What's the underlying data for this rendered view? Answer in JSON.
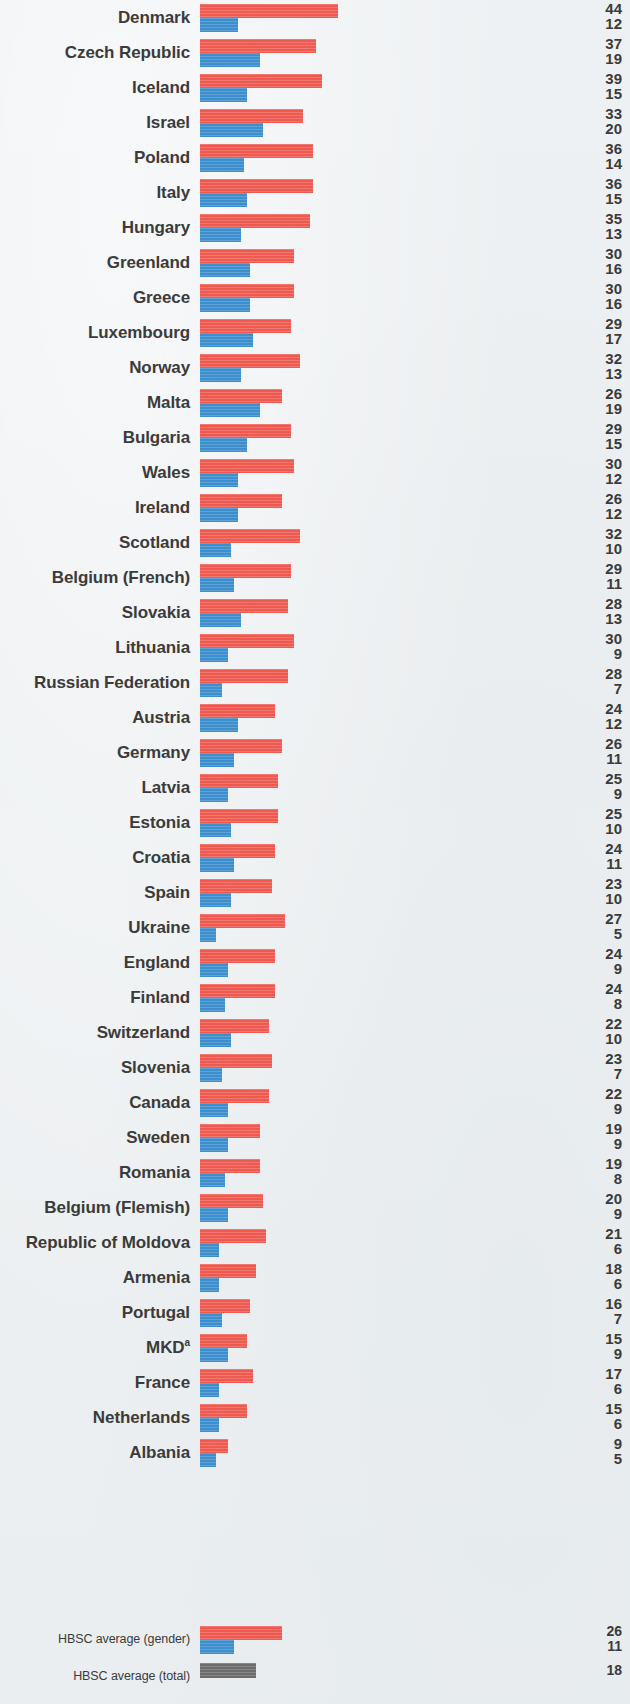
{
  "chart_data": {
    "type": "bar",
    "orientation": "horizontal",
    "title": "",
    "subtitle": "",
    "xlabel": "",
    "ylabel": "",
    "grid": false,
    "legend_position": "none",
    "xlim": [
      0,
      44
    ],
    "value_unit": "%",
    "series": [
      {
        "name": "girls",
        "color": "#ef5a50"
      },
      {
        "name": "boys",
        "color": "#3d8ecd"
      },
      {
        "name": "total",
        "color": "#6d6d6d"
      }
    ],
    "categories": [
      "Denmark",
      "Czech Republic",
      "Iceland",
      "Israel",
      "Poland",
      "Italy",
      "Hungary",
      "Greenland",
      "Greece",
      "Luxembourg",
      "Norway",
      "Malta",
      "Bulgaria",
      "Wales",
      "Ireland",
      "Scotland",
      "Belgium (French)",
      "Slovakia",
      "Lithuania",
      "Russian Federation",
      "Austria",
      "Germany",
      "Latvia",
      "Estonia",
      "Croatia",
      "Spain",
      "Ukraine",
      "England",
      "Finland",
      "Switzerland",
      "Slovenia",
      "Canada",
      "Sweden",
      "Romania",
      "Belgium (Flemish)",
      "Republic of Moldova",
      "Armenia",
      "Portugal",
      "MKD",
      "France",
      "Netherlands",
      "Albania",
      "HBSC average (gender)",
      "HBSC average (total)"
    ],
    "values_red": [
      44,
      37,
      39,
      33,
      36,
      36,
      35,
      30,
      30,
      29,
      32,
      26,
      29,
      30,
      26,
      32,
      29,
      28,
      30,
      28,
      24,
      26,
      25,
      25,
      24,
      23,
      27,
      24,
      24,
      22,
      23,
      22,
      19,
      19,
      20,
      21,
      18,
      16,
      15,
      17,
      15,
      9,
      26,
      null
    ],
    "values_blue": [
      12,
      19,
      15,
      20,
      14,
      15,
      13,
      16,
      16,
      17,
      13,
      19,
      15,
      12,
      12,
      10,
      11,
      13,
      9,
      7,
      12,
      11,
      9,
      10,
      11,
      10,
      5,
      9,
      8,
      10,
      7,
      9,
      9,
      8,
      9,
      6,
      6,
      7,
      9,
      6,
      6,
      5,
      11,
      null
    ],
    "values_gray": [
      null,
      null,
      null,
      null,
      null,
      null,
      null,
      null,
      null,
      null,
      null,
      null,
      null,
      null,
      null,
      null,
      null,
      null,
      null,
      null,
      null,
      null,
      null,
      null,
      null,
      null,
      null,
      null,
      null,
      null,
      null,
      null,
      null,
      null,
      null,
      null,
      null,
      null,
      null,
      null,
      null,
      null,
      null,
      18
    ]
  },
  "rows": [
    {
      "label": "Denmark",
      "sup": "",
      "red": 44,
      "blue": 12
    },
    {
      "label": "Czech Republic",
      "sup": "",
      "red": 37,
      "blue": 19
    },
    {
      "label": "Iceland",
      "sup": "",
      "red": 39,
      "blue": 15
    },
    {
      "label": "Israel",
      "sup": "",
      "red": 33,
      "blue": 20
    },
    {
      "label": "Poland",
      "sup": "",
      "red": 36,
      "blue": 14
    },
    {
      "label": "Italy",
      "sup": "",
      "red": 36,
      "blue": 15
    },
    {
      "label": "Hungary",
      "sup": "",
      "red": 35,
      "blue": 13
    },
    {
      "label": "Greenland",
      "sup": "",
      "red": 30,
      "blue": 16
    },
    {
      "label": "Greece",
      "sup": "",
      "red": 30,
      "blue": 16
    },
    {
      "label": "Luxembourg",
      "sup": "",
      "red": 29,
      "blue": 17
    },
    {
      "label": "Norway",
      "sup": "",
      "red": 32,
      "blue": 13
    },
    {
      "label": "Malta",
      "sup": "",
      "red": 26,
      "blue": 19
    },
    {
      "label": "Bulgaria",
      "sup": "",
      "red": 29,
      "blue": 15
    },
    {
      "label": "Wales",
      "sup": "",
      "red": 30,
      "blue": 12
    },
    {
      "label": "Ireland",
      "sup": "",
      "red": 26,
      "blue": 12
    },
    {
      "label": "Scotland",
      "sup": "",
      "red": 32,
      "blue": 10
    },
    {
      "label": "Belgium (French)",
      "sup": "",
      "red": 29,
      "blue": 11
    },
    {
      "label": "Slovakia",
      "sup": "",
      "red": 28,
      "blue": 13
    },
    {
      "label": "Lithuania",
      "sup": "",
      "red": 30,
      "blue": 9
    },
    {
      "label": "Russian Federation",
      "sup": "",
      "red": 28,
      "blue": 7
    },
    {
      "label": "Austria",
      "sup": "",
      "red": 24,
      "blue": 12
    },
    {
      "label": "Germany",
      "sup": "",
      "red": 26,
      "blue": 11
    },
    {
      "label": "Latvia",
      "sup": "",
      "red": 25,
      "blue": 9
    },
    {
      "label": "Estonia",
      "sup": "",
      "red": 25,
      "blue": 10
    },
    {
      "label": "Croatia",
      "sup": "",
      "red": 24,
      "blue": 11
    },
    {
      "label": "Spain",
      "sup": "",
      "red": 23,
      "blue": 10
    },
    {
      "label": "Ukraine",
      "sup": "",
      "red": 27,
      "blue": 5
    },
    {
      "label": "England",
      "sup": "",
      "red": 24,
      "blue": 9
    },
    {
      "label": "Finland",
      "sup": "",
      "red": 24,
      "blue": 8
    },
    {
      "label": "Switzerland",
      "sup": "",
      "red": 22,
      "blue": 10
    },
    {
      "label": "Slovenia",
      "sup": "",
      "red": 23,
      "blue": 7
    },
    {
      "label": "Canada",
      "sup": "",
      "red": 22,
      "blue": 9
    },
    {
      "label": "Sweden",
      "sup": "",
      "red": 19,
      "blue": 9
    },
    {
      "label": "Romania",
      "sup": "",
      "red": 19,
      "blue": 8
    },
    {
      "label": "Belgium (Flemish)",
      "sup": "",
      "red": 20,
      "blue": 9
    },
    {
      "label": "Republic of Moldova",
      "sup": "",
      "red": 21,
      "blue": 6
    },
    {
      "label": "Armenia",
      "sup": "",
      "red": 18,
      "blue": 6
    },
    {
      "label": "Portugal",
      "sup": "",
      "red": 16,
      "blue": 7
    },
    {
      "label": "MKD",
      "sup": "a",
      "red": 15,
      "blue": 9
    },
    {
      "label": "France",
      "sup": "",
      "red": 17,
      "blue": 6
    },
    {
      "label": "Netherlands",
      "sup": "",
      "red": 15,
      "blue": 6
    },
    {
      "label": "Albania",
      "sup": "",
      "red": 9,
      "blue": 5
    }
  ],
  "averages": [
    {
      "label": "HBSC average (gender)",
      "sup": "",
      "red": 26,
      "blue": 11
    },
    {
      "label": "HBSC average (total)",
      "sup": "",
      "gray": 18
    }
  ],
  "style": {
    "red": "#ef5a50",
    "blue": "#3d8ecd",
    "gray": "#6d6d6d",
    "text": "#3b3b3b",
    "background": "#eef1f2"
  }
}
